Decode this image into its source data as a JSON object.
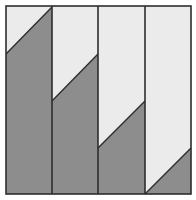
{
  "figure": {
    "colors": {
      "light": "#ebebeb",
      "dark": "#8d8d8d",
      "line": "#2e2e2e",
      "background": "#ffffff"
    },
    "frame": {
      "x": 6,
      "y": 6,
      "width": 185,
      "height": 188
    },
    "strips": [
      {
        "index": 1,
        "x0": 6,
        "x1": 52,
        "y_left": 54,
        "y_right": 7
      },
      {
        "index": 2,
        "x0": 52,
        "x1": 98,
        "y_left": 101,
        "y_right": 54
      },
      {
        "index": 3,
        "x0": 98,
        "x1": 145,
        "y_left": 148,
        "y_right": 101
      },
      {
        "index": 4,
        "x0": 145,
        "x1": 191,
        "y_left": 194,
        "y_right": 148
      }
    ]
  }
}
